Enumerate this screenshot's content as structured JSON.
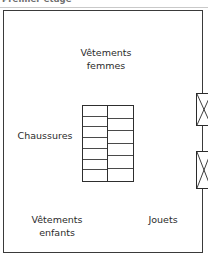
{
  "header": {
    "title": "Premier étage"
  },
  "floorplan": {
    "name": "store-floor-plan",
    "outline_color": "#3a3a3a",
    "background_color": "#ffffff",
    "zones": [
      {
        "id": "vetements-femmes",
        "label": "Vêtements\nfemmes",
        "position": "top-center"
      },
      {
        "id": "chaussures",
        "label": "Chaussures",
        "position": "middle-left"
      },
      {
        "id": "vetements-enfants",
        "label": "Vêtements\nenfants",
        "position": "bottom-left"
      },
      {
        "id": "jouets",
        "label": "Jouets",
        "position": "bottom-right"
      }
    ],
    "shelving_unit": {
      "name": "central-shelving-unit",
      "columns": 2,
      "left_column_cells": 7,
      "right_column_cells": 6,
      "stroke_color": "#2e2e2e"
    },
    "fitting_rooms": [
      {
        "id": "fitting-room-upper",
        "marker": "X",
        "position": "right-edge-upper"
      },
      {
        "id": "fitting-room-lower",
        "marker": "X",
        "position": "right-edge-lower"
      }
    ]
  }
}
